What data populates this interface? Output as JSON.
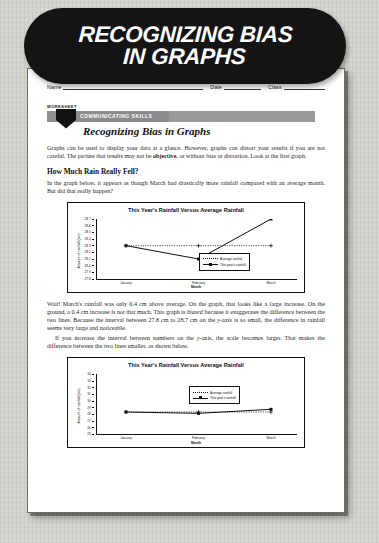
{
  "header": {
    "title_line1": "RECOGNIZING BIAS",
    "title_line2": "IN GRAPHS"
  },
  "form": {
    "name_label": "Name",
    "date_label": "Date",
    "class_label": "Class"
  },
  "worksheet": {
    "tag": "WORKSHEET",
    "banner": "COMMUNICATING SKILLS",
    "subtitle": "Recognizing Bias in Graphs"
  },
  "intro": {
    "p1_a": "Graphs can be used to display your data at a glance. However, graphs can distort your results if you are not careful. The picture that results may not be ",
    "p1_bold": "objective",
    "p1_b": ", or without bias or distortion. Look at the first graph."
  },
  "section1": {
    "heading": "How Much Rain Really Fell?",
    "paragraph": "In the graph below, it appears as though March had drastically more rainfall compared with an average month. But did that really happen?"
  },
  "discussion": {
    "p1_a": "Wait! March's rainfall was only 0.4 cm above average. On the graph, that looks like a large increase. On the ground, a 0.4 cm increase is not that much. This graph is ",
    "p1_i": "biased",
    "p1_b": " because it exaggerates the difference between the two lines. Because the interval between 27.8 cm to 28.7 cm on the ",
    "p1_i2": "y",
    "p1_c": "-axis is so small, the difference in rainfall seems very large and noticeable.",
    "p2_a": "If you increase the interval between numbers on the ",
    "p2_i": "y",
    "p2_b": "-axis, the scale becomes larger. That makes the difference between the two lines smaller, as shown below."
  },
  "chart_data": [
    {
      "type": "line",
      "title": "This Year's Rainfall Versus Average Rainfall",
      "xlabel": "Month",
      "ylabel": "Amount of rainfall (cm)",
      "categories": [
        "January",
        "February",
        "March"
      ],
      "ylim": [
        27.8,
        28.7
      ],
      "yticks": [
        27.8,
        27.9,
        28.0,
        28.1,
        28.2,
        28.3,
        28.4,
        28.5,
        28.6,
        28.7
      ],
      "ytick_labels": [
        "27.8",
        "27.9",
        "28.0",
        "28.1",
        "28.2",
        "28.3",
        "28.4",
        "28.5",
        "28.6",
        "28.7"
      ],
      "grid": false,
      "legend_position": "inside-right-lower",
      "series": [
        {
          "name": "Average rainfall",
          "values": [
            28.3,
            28.3,
            28.3
          ],
          "style": "dotted"
        },
        {
          "name": "This year's rainfall",
          "values": [
            28.3,
            28.1,
            28.7
          ],
          "style": "solid"
        }
      ]
    },
    {
      "type": "line",
      "title": "This Year's Rainfall Versus Average Rainfall",
      "xlabel": "Month",
      "ylabel": "Amount of rainfall (cm)",
      "categories": [
        "January",
        "February",
        "March"
      ],
      "ylim": [
        25,
        34
      ],
      "yticks": [
        25,
        26,
        27,
        28,
        29,
        30,
        31,
        32,
        33,
        34
      ],
      "ytick_labels": [
        "25",
        "26",
        "27",
        "28",
        "29",
        "30",
        "31",
        "32",
        "33",
        "34"
      ],
      "grid": false,
      "legend_position": "inside-right-upper",
      "series": [
        {
          "name": "Average rainfall",
          "values": [
            28.3,
            28.3,
            28.3
          ],
          "style": "dotted"
        },
        {
          "name": "This year's rainfall",
          "values": [
            28.3,
            28.1,
            28.7
          ],
          "style": "solid"
        }
      ]
    }
  ]
}
